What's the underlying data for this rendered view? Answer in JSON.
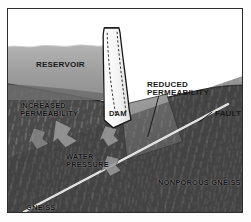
{
  "figure": {
    "kind": "geological-cross-section"
  },
  "labels": {
    "reservoir": "RESERVOIR",
    "dam": "DAM",
    "reduced_permeability": "REDUCED\nPERMEABILITY",
    "increased_permeability": "INCREASED\nPERMEABILITY",
    "water_pressure": "WATER\nPRESSURE",
    "fault": "FAULT",
    "nonporous_gneiss": "NONPOROUS GNEISS",
    "gneiss": "GNEISS"
  },
  "colors": {
    "frame_border": "#2b2b2b",
    "sky": "#ffffff",
    "water": "#9a9a9a",
    "water_top": "#b0b0b0",
    "rock_dark": "#4a4a4a",
    "rock_darker": "#3a3a3a",
    "reduced_zone": "#8d8d8d",
    "dam_fill": "#f4f4f4",
    "dam_outline": "#1c1c1c",
    "fault_line": "#f2f2f2",
    "arrow_fill": "#9b9b9b",
    "leader_line": "#111111"
  },
  "elements": {
    "fault_line_name": "fault-line",
    "dam_structure_name": "dam-structure",
    "reservoir_body_name": "reservoir-water-body",
    "reduced_zone_name": "reduced-permeability-zone",
    "pressure_arrows_name": "water-pressure-arrows"
  }
}
